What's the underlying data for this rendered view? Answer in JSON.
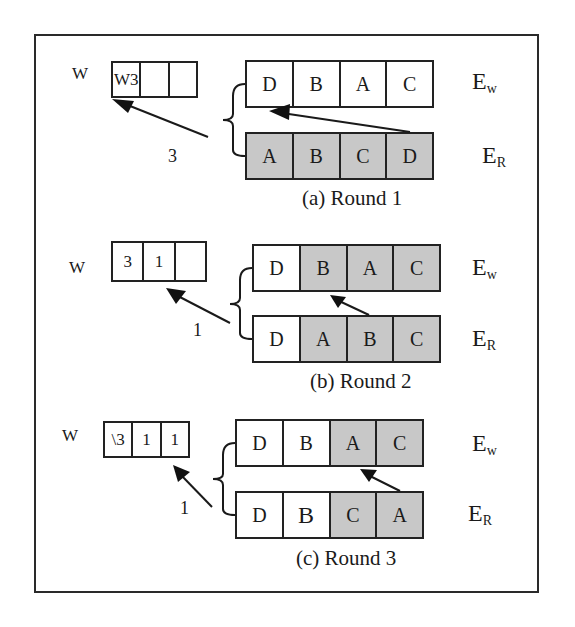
{
  "figure": {
    "rounds": [
      {
        "caption": "(a) Round 1",
        "w_label": "W",
        "w_array": [
          "W3",
          "",
          ""
        ],
        "arrow_value": "3",
        "ew_row": [
          {
            "label": "D",
            "shaded": false
          },
          {
            "label": "B",
            "shaded": false
          },
          {
            "label": "A",
            "shaded": false
          },
          {
            "label": "C",
            "shaded": false
          }
        ],
        "er_row": [
          {
            "label": "A",
            "shaded": true
          },
          {
            "label": "B",
            "shaded": true
          },
          {
            "label": "C",
            "shaded": true
          },
          {
            "label": "D",
            "shaded": true
          }
        ],
        "ew_label": "E",
        "ew_sub": "w",
        "er_label": "E",
        "er_sub": "R"
      },
      {
        "caption": "(b) Round 2",
        "w_label": "W",
        "w_array": [
          "3",
          "1",
          ""
        ],
        "arrow_value": "1",
        "ew_row": [
          {
            "label": "D",
            "shaded": false
          },
          {
            "label": "B",
            "shaded": true
          },
          {
            "label": "A",
            "shaded": true
          },
          {
            "label": "C",
            "shaded": true
          }
        ],
        "er_row": [
          {
            "label": "D",
            "shaded": false
          },
          {
            "label": "A",
            "shaded": true
          },
          {
            "label": "B",
            "shaded": true
          },
          {
            "label": "C",
            "shaded": true
          }
        ],
        "ew_label": "E",
        "ew_sub": "w",
        "er_label": "E",
        "er_sub": "R"
      },
      {
        "caption": "(c) Round 3",
        "w_label": "W",
        "w_array": [
          "\\3",
          "1",
          "1"
        ],
        "arrow_value": "1",
        "ew_row": [
          {
            "label": "D",
            "shaded": false
          },
          {
            "label": "B",
            "shaded": false
          },
          {
            "label": "A",
            "shaded": true
          },
          {
            "label": "C",
            "shaded": true
          }
        ],
        "er_row": [
          {
            "label": "D",
            "shaded": false
          },
          {
            "label": "B",
            "shaded": false
          },
          {
            "label": "C",
            "shaded": true
          },
          {
            "label": "A",
            "shaded": true
          }
        ],
        "ew_label": "E",
        "ew_sub": "w",
        "er_label": "E",
        "er_sub": "R"
      }
    ],
    "colors": {
      "shaded": "#c8c8c8",
      "line": "#222222"
    }
  }
}
